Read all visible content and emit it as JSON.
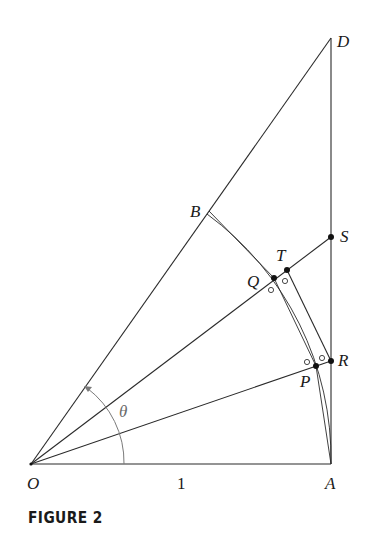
{
  "figure": {
    "caption": "FIGURE 2",
    "labels": {
      "O": "O",
      "A": "A",
      "B": "B",
      "D": "D",
      "S": "S",
      "T": "T",
      "Q": "Q",
      "R": "R",
      "P": "P",
      "theta": "θ",
      "unit_length": "1"
    },
    "points_px": {
      "O": [
        31,
        464
      ],
      "A": [
        331,
        464
      ],
      "D": [
        331,
        38
      ],
      "B": [
        207,
        214
      ],
      "S": [
        331,
        237
      ],
      "T": [
        287,
        270
      ],
      "Q": [
        274,
        278
      ],
      "R": [
        331,
        361
      ],
      "P": [
        316,
        366
      ]
    },
    "colors": {
      "line": "#2a2a2a",
      "angle_arc": "#7a7a7a",
      "point": "#111111"
    }
  }
}
